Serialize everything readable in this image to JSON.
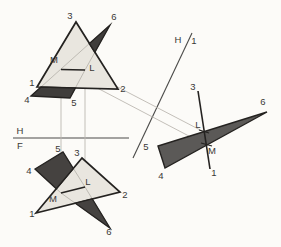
{
  "figure": {
    "colors": {
      "background": "#fcfbf8",
      "ink": "#242220",
      "light_fill": "#e9e6df",
      "dark_fill_top": "#3f3d3b",
      "dark_fill_front": "#454240",
      "dark_fill_aux": "#5b5957",
      "construction": "#bcb8b1",
      "fold_line": "#4a4a48",
      "label": "#3a3836"
    }
  },
  "drawing": {
    "width": 281,
    "height": 247,
    "label_font_size": 9.5,
    "layers": [
      {
        "type": "line",
        "name": "fold-line-hf",
        "x1": 13,
        "y1": 138,
        "x2": 129,
        "y2": 138,
        "stroke": "#4a4a48",
        "w": 1.1
      },
      {
        "type": "line",
        "name": "fold-line-h1",
        "x1": 192,
        "y1": 33,
        "x2": 133,
        "y2": 158,
        "stroke": "#4a4a48",
        "w": 1.1
      },
      {
        "type": "line",
        "name": "projector-vertical-m",
        "x1": 61,
        "y1": 71,
        "x2": 61,
        "y2": 192,
        "stroke": "#bcb8b1",
        "w": 0.9
      },
      {
        "type": "line",
        "name": "projector-vertical-l",
        "x1": 85,
        "y1": 71,
        "x2": 85,
        "y2": 186,
        "stroke": "#bcb8b1",
        "w": 0.9
      },
      {
        "type": "line",
        "name": "projector-aux-l",
        "x1": 85,
        "y1": 70,
        "x2": 204,
        "y2": 132,
        "stroke": "#bcb8b1",
        "w": 0.9
      },
      {
        "type": "line",
        "name": "projector-aux-m",
        "x1": 61,
        "y1": 69,
        "x2": 206,
        "y2": 145,
        "stroke": "#bcb8b1",
        "w": 0.9
      },
      {
        "type": "polygon",
        "name": "top-triangle-123-fill",
        "points": [
          [
            37,
            87
          ],
          [
            118,
            89
          ],
          [
            76,
            22
          ]
        ],
        "fill": "#e9e6df"
      },
      {
        "type": "polyline",
        "name": "top-hidden-edge-4-6",
        "points": [
          [
            31,
            96
          ],
          [
            61,
            69
          ],
          [
            110,
            25
          ]
        ],
        "stroke": "#bcb8b1",
        "w": 0.95
      },
      {
        "type": "polyline",
        "name": "top-hidden-edge-5-6",
        "points": [
          [
            70,
            98
          ],
          [
            85,
            70
          ],
          [
            110,
            25
          ]
        ],
        "stroke": "#bcb8b1",
        "w": 0.95
      },
      {
        "type": "polygon",
        "name": "top-triangle-123-outline",
        "points": [
          [
            37,
            87
          ],
          [
            118,
            89
          ],
          [
            76,
            22
          ]
        ],
        "stroke": "#242220",
        "w": 1.7
      },
      {
        "type": "polygon",
        "name": "top-456-visible-quad",
        "points": [
          [
            31,
            96
          ],
          [
            70,
            98
          ],
          [
            75.4,
            88
          ],
          [
            41,
            87
          ]
        ],
        "fill": "#3f3d3b",
        "stroke": "#242220",
        "w": 1.3
      },
      {
        "type": "polygon",
        "name": "top-456-visible-sliver",
        "points": [
          [
            89.4,
            43.5
          ],
          [
            110,
            25
          ],
          [
            94.9,
            52.2
          ]
        ],
        "fill": "#3f3d3b",
        "stroke": "#242220",
        "w": 1.3
      },
      {
        "type": "line",
        "name": "top-intersection-line-ml",
        "x1": 61,
        "y1": 69.5,
        "x2": 85,
        "y2": 70,
        "stroke": "#242220",
        "w": 1.4
      },
      {
        "type": "polygon",
        "name": "front-triangle-123-fill",
        "points": [
          [
            36,
            213
          ],
          [
            120,
            192
          ],
          [
            82,
            158
          ]
        ],
        "fill": "#e9e6df"
      },
      {
        "type": "polyline",
        "name": "front-hidden-edge-4-6",
        "points": [
          [
            35,
            169
          ],
          [
            61,
            193
          ],
          [
            110,
            228
          ]
        ],
        "stroke": "#bcb8b1",
        "w": 0.95
      },
      {
        "type": "polyline",
        "name": "front-hidden-edge-5-6",
        "points": [
          [
            63,
            152
          ],
          [
            85,
            187
          ],
          [
            110,
            228
          ]
        ],
        "stroke": "#bcb8b1",
        "w": 0.95
      },
      {
        "type": "polygon",
        "name": "front-triangle-123-outline",
        "points": [
          [
            36,
            213
          ],
          [
            120,
            192
          ],
          [
            82,
            158
          ]
        ],
        "stroke": "#242220",
        "w": 1.7
      },
      {
        "type": "polygon",
        "name": "front-456-visible-quad",
        "points": [
          [
            35,
            169
          ],
          [
            63,
            152
          ],
          [
            73.3,
            168.4
          ],
          [
            56.3,
            188.7
          ]
        ],
        "fill": "#454240",
        "stroke": "#242220",
        "w": 1.3
      },
      {
        "type": "polygon",
        "name": "front-456-visible-sliver",
        "points": [
          [
            75.3,
            203.2
          ],
          [
            110,
            228
          ],
          [
            92.3,
            198.9
          ]
        ],
        "fill": "#454240",
        "stroke": "#242220",
        "w": 1.3
      },
      {
        "type": "line",
        "name": "front-intersection-line-ml",
        "x1": 61,
        "y1": 193,
        "x2": 85,
        "y2": 187,
        "stroke": "#242220",
        "w": 1.4
      },
      {
        "type": "polygon",
        "name": "aux-triangle-456",
        "points": [
          [
            158,
            146
          ],
          [
            165,
            168
          ],
          [
            267,
            112
          ]
        ],
        "fill": "#5b5957",
        "stroke": "#242220",
        "w": 1.4
      },
      {
        "type": "line",
        "name": "aux-edge-view-line-3-1",
        "x1": 198,
        "y1": 91,
        "x2": 210,
        "y2": 169,
        "stroke": "#242220",
        "w": 1.6
      },
      {
        "type": "line",
        "name": "aux-tick-l",
        "x1": 199,
        "y1": 130,
        "x2": 209,
        "y2": 133,
        "stroke": "#242220",
        "w": 1.2
      },
      {
        "type": "line",
        "name": "aux-tick-m",
        "x1": 201,
        "y1": 143,
        "x2": 212,
        "y2": 146,
        "stroke": "#242220",
        "w": 1.2
      },
      {
        "type": "text",
        "name": "label-top-3",
        "text": "3",
        "x": 70,
        "y": 19
      },
      {
        "type": "text",
        "name": "label-top-6",
        "text": "6",
        "x": 114,
        "y": 20
      },
      {
        "type": "text",
        "name": "label-top-m",
        "text": "M",
        "x": 54,
        "y": 63
      },
      {
        "type": "text",
        "name": "label-top-l",
        "text": "L",
        "x": 92,
        "y": 71
      },
      {
        "type": "text",
        "name": "label-top-1",
        "text": "1",
        "x": 32,
        "y": 86
      },
      {
        "type": "text",
        "name": "label-top-2",
        "text": "2",
        "x": 123,
        "y": 92
      },
      {
        "type": "text",
        "name": "label-top-4",
        "text": "4",
        "x": 27,
        "y": 103
      },
      {
        "type": "text",
        "name": "label-top-5",
        "text": "5",
        "x": 74,
        "y": 106
      },
      {
        "type": "text",
        "name": "label-fold-hf-h",
        "text": "H",
        "x": 20,
        "y": 134
      },
      {
        "type": "text",
        "name": "label-fold-hf-f",
        "text": "F",
        "x": 20,
        "y": 149
      },
      {
        "type": "text",
        "name": "label-front-5",
        "text": "5",
        "x": 58,
        "y": 152
      },
      {
        "type": "text",
        "name": "label-front-3",
        "text": "3",
        "x": 77,
        "y": 156
      },
      {
        "type": "text",
        "name": "label-front-4",
        "text": "4",
        "x": 29,
        "y": 174
      },
      {
        "type": "text",
        "name": "label-front-l",
        "text": "L",
        "x": 88,
        "y": 185
      },
      {
        "type": "text",
        "name": "label-front-2",
        "text": "2",
        "x": 125,
        "y": 198
      },
      {
        "type": "text",
        "name": "label-front-m",
        "text": "M",
        "x": 53,
        "y": 202
      },
      {
        "type": "text",
        "name": "label-front-1",
        "text": "1",
        "x": 32,
        "y": 217
      },
      {
        "type": "text",
        "name": "label-front-6",
        "text": "6",
        "x": 109,
        "y": 235
      },
      {
        "type": "text",
        "name": "label-fold-h1-h",
        "text": "H",
        "x": 178,
        "y": 43
      },
      {
        "type": "text",
        "name": "label-fold-h1-1",
        "text": "1",
        "x": 194,
        "y": 44
      },
      {
        "type": "text",
        "name": "label-aux-3",
        "text": "3",
        "x": 193,
        "y": 90
      },
      {
        "type": "text",
        "name": "label-aux-6",
        "text": "6",
        "x": 263,
        "y": 105
      },
      {
        "type": "text",
        "name": "label-aux-5",
        "text": "5",
        "x": 146,
        "y": 150
      },
      {
        "type": "text",
        "name": "label-aux-l",
        "text": "L",
        "x": 198,
        "y": 128
      },
      {
        "type": "text",
        "name": "label-aux-m",
        "text": "M",
        "x": 212,
        "y": 154
      },
      {
        "type": "text",
        "name": "label-aux-4",
        "text": "4",
        "x": 161,
        "y": 179
      },
      {
        "type": "text",
        "name": "label-aux-1",
        "text": "1",
        "x": 214,
        "y": 176
      }
    ]
  }
}
